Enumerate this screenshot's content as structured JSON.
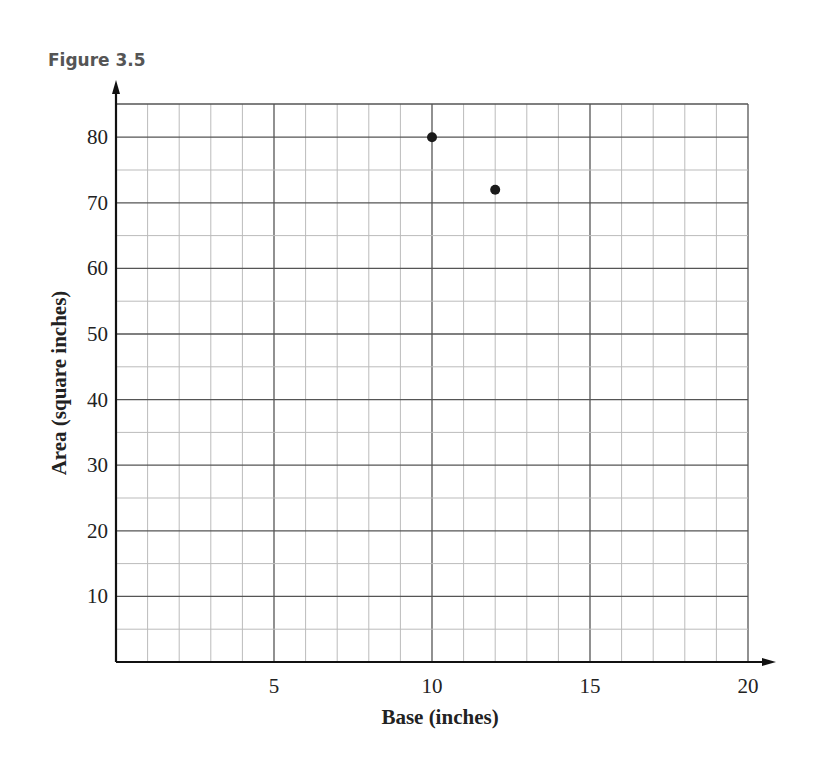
{
  "figure_label": "Figure 3.5",
  "chart_data": {
    "type": "scatter",
    "title": "",
    "xlabel": "Base (inches)",
    "ylabel": "Area (square inches)",
    "xlim": [
      0,
      20
    ],
    "ylim": [
      0,
      85
    ],
    "x_ticks": [
      5,
      10,
      15,
      20
    ],
    "y_ticks": [
      10,
      20,
      30,
      40,
      50,
      60,
      70,
      80
    ],
    "grid": true,
    "series": [
      {
        "name": "points",
        "x": [
          10,
          12
        ],
        "y": [
          80,
          72
        ]
      }
    ]
  }
}
